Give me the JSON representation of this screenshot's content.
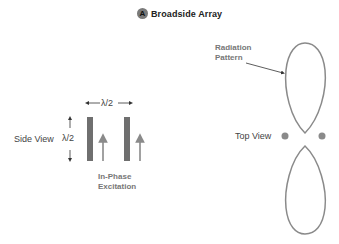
{
  "title": {
    "badge": "A",
    "text": "Broadside Array"
  },
  "side_view": {
    "label": "Side View",
    "height_label": "λ/2",
    "spacing_label": "λ/2",
    "excitation_label_line1": "In-Phase",
    "excitation_label_line2": "Excitation"
  },
  "top_view": {
    "label": "Top View",
    "pattern_label_line1": "Radiation",
    "pattern_label_line2": "Pattern"
  },
  "colors": {
    "element": "#6f6f6f",
    "arrow": "#8a8a8a",
    "lobe": "#8a8a8a",
    "text": "#444444"
  }
}
